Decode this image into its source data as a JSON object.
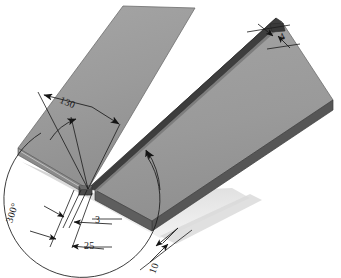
{
  "figure": {
    "type": "engineering-dimension-drawing",
    "projection": "isometric",
    "background_color": "#ffffff"
  },
  "colors": {
    "plate_top": "#9b9b9b",
    "plate_top_highlight": "#a8a8a8",
    "plate_edge_side": "#4d4d4d",
    "plate_edge_front": "#6e6e6e",
    "groove_dark": "#3f3f3f",
    "groove_mid": "#555555",
    "shadow": "#cfcfcf",
    "line": "#1a1a1a",
    "leader": "#2b2b2b"
  },
  "dimensions": [
    {
      "id": "groove-angle",
      "value": "130",
      "unit": "degrees",
      "label": "130",
      "description": "Included V-groove angle measured at the root of the joint"
    },
    {
      "id": "total-sweep-angle",
      "value": "300",
      "unit": "degrees",
      "label": "300°",
      "description": "Large reference arc angle swept about the groove root"
    },
    {
      "id": "root-gap",
      "value": "3",
      "unit": "mm",
      "label": "3",
      "description": "Root gap between the two plate edges"
    },
    {
      "id": "groove-width",
      "value": "25",
      "unit": "mm",
      "label": "25",
      "description": "Overall width of the groove opening at the plate surface"
    },
    {
      "id": "plate-thickness",
      "value": "10",
      "unit": "mm",
      "label": "10",
      "description": "Thickness of the plate measured on the near edge"
    },
    {
      "id": "root-face",
      "value": "4",
      "unit": "mm",
      "label": "4",
      "description": "Root face / land height shown at the far end of the joint"
    }
  ],
  "labels": {
    "d130": "130",
    "d300": "300°",
    "d3": "3",
    "d25": "25",
    "d10": "10",
    "d4": "4"
  },
  "parts": [
    {
      "id": "left-plate",
      "name": "Left plate",
      "surface": "top face shaded medium gray",
      "beveled": true
    },
    {
      "id": "right-plate",
      "name": "Right plate",
      "surface": "top face shaded medium gray",
      "beveled": true
    },
    {
      "id": "weld-groove",
      "name": "V-groove seam",
      "surface": "dark recessed channel running diagonally between the plates"
    }
  ]
}
